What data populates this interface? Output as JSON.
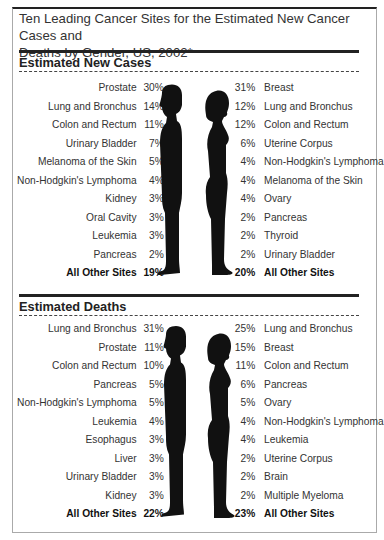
{
  "title": "Ten Leading Cancer Sites for the Estimated New Cancer Cases and Deaths by Gender, US, 2002*",
  "title_line1": "Ten Leading Cancer Sites for the Estimated New Cancer Cases and",
  "title_line2": "Deaths by Gender, US, 2002*",
  "colors": {
    "ink": "#222222",
    "silhouette": "#111111",
    "text": "#333333",
    "frame": "#aaaaaa"
  },
  "chart_data": {
    "type": "table",
    "title": "Ten Leading Cancer Sites for the Estimated New Cancer Cases and Deaths by Gender, US, 2002*",
    "sections": [
      {
        "heading": "Estimated New Cases",
        "male": [
          {
            "site": "Prostate",
            "pct": "30%"
          },
          {
            "site": "Lung and Bronchus",
            "pct": "14%"
          },
          {
            "site": "Colon and Rectum",
            "pct": "11%"
          },
          {
            "site": "Urinary Bladder",
            "pct": "7%"
          },
          {
            "site": "Melanoma of the Skin",
            "pct": "5%"
          },
          {
            "site": "Non-Hodgkin's Lymphoma",
            "pct": "4%"
          },
          {
            "site": "Kidney",
            "pct": "3%"
          },
          {
            "site": "Oral Cavity",
            "pct": "3%"
          },
          {
            "site": "Leukemia",
            "pct": "3%"
          },
          {
            "site": "Pancreas",
            "pct": "2%"
          },
          {
            "site": "All Other Sites",
            "pct": "19%",
            "total": true
          }
        ],
        "female": [
          {
            "site": "Breast",
            "pct": "31%"
          },
          {
            "site": "Lung and Bronchus",
            "pct": "12%"
          },
          {
            "site": "Colon and Rectum",
            "pct": "12%"
          },
          {
            "site": "Uterine Corpus",
            "pct": "6%"
          },
          {
            "site": "Non-Hodgkin's Lymphoma",
            "pct": "4%"
          },
          {
            "site": "Melanoma of the Skin",
            "pct": "4%"
          },
          {
            "site": "Ovary",
            "pct": "4%"
          },
          {
            "site": "Pancreas",
            "pct": "2%"
          },
          {
            "site": "Thyroid",
            "pct": "2%"
          },
          {
            "site": "Urinary Bladder",
            "pct": "2%"
          },
          {
            "site": "All Other Sites",
            "pct": "20%",
            "total": true
          }
        ]
      },
      {
        "heading": "Estimated Deaths",
        "male": [
          {
            "site": "Lung and Bronchus",
            "pct": "31%"
          },
          {
            "site": "Prostate",
            "pct": "11%"
          },
          {
            "site": "Colon and Rectum",
            "pct": "10%"
          },
          {
            "site": "Pancreas",
            "pct": "5%"
          },
          {
            "site": "Non-Hodgkin's Lymphoma",
            "pct": "5%"
          },
          {
            "site": "Leukemia",
            "pct": "4%"
          },
          {
            "site": "Esophagus",
            "pct": "3%"
          },
          {
            "site": "Liver",
            "pct": "3%"
          },
          {
            "site": "Urinary Bladder",
            "pct": "3%"
          },
          {
            "site": "Kidney",
            "pct": "3%"
          },
          {
            "site": "All Other Sites",
            "pct": "22%",
            "total": true
          }
        ],
        "female": [
          {
            "site": "Lung and Bronchus",
            "pct": "25%"
          },
          {
            "site": "Breast",
            "pct": "15%"
          },
          {
            "site": "Colon and Rectum",
            "pct": "11%"
          },
          {
            "site": "Pancreas",
            "pct": "6%"
          },
          {
            "site": "Ovary",
            "pct": "5%"
          },
          {
            "site": "Non-Hodgkin's Lymphoma",
            "pct": "4%"
          },
          {
            "site": "Leukemia",
            "pct": "4%"
          },
          {
            "site": "Uterine Corpus",
            "pct": "2%"
          },
          {
            "site": "Brain",
            "pct": "2%"
          },
          {
            "site": "Multiple Myeloma",
            "pct": "2%"
          },
          {
            "site": "All Other Sites",
            "pct": "23%",
            "total": true
          }
        ]
      }
    ],
    "icons": [
      "male-silhouette-icon",
      "female-silhouette-icon"
    ]
  }
}
